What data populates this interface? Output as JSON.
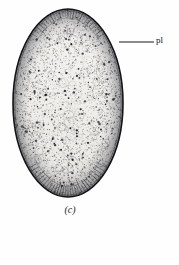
{
  "figure": {
    "panel_caption": "(c)",
    "labels": [
      {
        "id": "pl",
        "text": "pl",
        "leader_from_x": 119,
        "leader_from_y": 42,
        "leader_to_x": 154,
        "leader_to_y": 42
      }
    ],
    "colors": {
      "ink": "#1a1a1e",
      "outline": "#141418",
      "stipple": "#3c3c42",
      "paper": "#fefefe",
      "interior_fill": "#f2f1ee"
    },
    "geometry": {
      "center_x": 68,
      "center_y": 103,
      "radius_x": 55,
      "radius_y": 94,
      "outline_width": 1.6,
      "palisade_rim_thickness": 9
    },
    "texture": {
      "stipple_density": "fine-dense",
      "nuclei_count": 150,
      "vacuole_rings": 46,
      "palisade_cells_top": 26,
      "palisade_cells_bottom": 30
    }
  }
}
